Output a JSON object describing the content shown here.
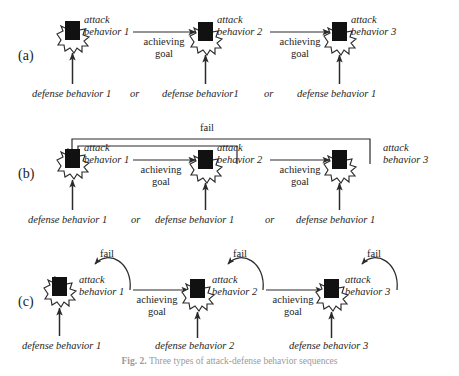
{
  "figure": {
    "caption_label": "Fig. 2.",
    "caption_text": "Three types of attack-defense behavior sequences",
    "panels": [
      {
        "id": "a",
        "label": "(a)",
        "nodes": [
          {
            "name": "node-1",
            "attack_line1": "attack",
            "attack_line2": "behavior 1",
            "defense": "defense behavior 1",
            "incoming_attack_arrow": false
          },
          {
            "name": "node-2",
            "attack_line1": "attack",
            "attack_line2": "behavior 2",
            "defense": "defense behavior1",
            "incoming_attack_arrow": true
          },
          {
            "name": "node-3",
            "attack_line1": "attack",
            "attack_line2": "behavior 3",
            "defense": "defense behavior 1",
            "incoming_attack_arrow": true
          }
        ],
        "transitions": [
          {
            "line1": "achieving",
            "line2": "goal"
          },
          {
            "line1": "achieving",
            "line2": "goal"
          }
        ],
        "separators": [
          "or",
          "or"
        ],
        "fail_labels": []
      },
      {
        "id": "b",
        "label": "(b)",
        "nodes": [
          {
            "name": "node-1",
            "attack_line1": "attack",
            "attack_line2": "behavior 1",
            "defense": "defense behavior 1",
            "incoming_attack_arrow": false
          },
          {
            "name": "node-2",
            "attack_line1": "attack",
            "attack_line2": "behavior 2",
            "defense": "defense behavior 1",
            "incoming_attack_arrow": true
          },
          {
            "name": "node-3",
            "attack_line1": "attack",
            "attack_line2": "behavior 3",
            "defense": "defense behavior 1",
            "incoming_attack_arrow": true
          }
        ],
        "transitions": [
          {
            "line1": "achieving",
            "line2": "goal"
          },
          {
            "line1": "achieving",
            "line2": "goal"
          }
        ],
        "separators": [
          "or",
          "or"
        ],
        "fail_labels": [
          "fail"
        ]
      },
      {
        "id": "c",
        "label": "(c)",
        "nodes": [
          {
            "name": "node-1",
            "attack_line1": "attack",
            "attack_line2": "behavior 1",
            "defense": "defense behavior 1",
            "incoming_attack_arrow": false
          },
          {
            "name": "node-2",
            "attack_line1": "attack",
            "attack_line2": "behavior 2",
            "defense": "defense behavior 2",
            "incoming_attack_arrow": true
          },
          {
            "name": "node-3",
            "attack_line1": "attack",
            "attack_line2": "behavior 3",
            "defense": "defense behavior 3",
            "incoming_attack_arrow": true
          }
        ],
        "transitions": [
          {
            "line1": "achieving",
            "line2": "goal"
          },
          {
            "line1": "achieving",
            "line2": "goal"
          }
        ],
        "separators": [],
        "fail_labels": [
          "fail",
          "fail",
          "fail"
        ]
      }
    ],
    "colors": {
      "node_fill": "#111111",
      "stroke": "#2b2b2b",
      "text": "#1d1d1d",
      "background": "#ffffff"
    }
  }
}
